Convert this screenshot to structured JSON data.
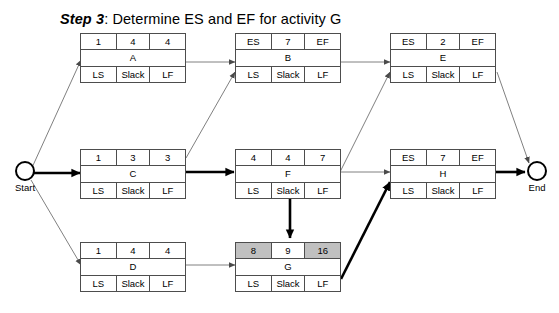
{
  "title": {
    "step": "Step 3",
    "rest": ": Determine ES and EF for activity G"
  },
  "colors": {
    "highlight": "#c0c0c0",
    "box_border": "#4d4d4d",
    "thin_edge": "#808080",
    "bold_edge": "#000000",
    "text": "#000000",
    "background": "#ffffff"
  },
  "terminators": {
    "start": {
      "label": "Start"
    },
    "end": {
      "label": "End"
    }
  },
  "labels": {
    "ls": "LS",
    "slack": "Slack",
    "lf": "LF",
    "es": "ES",
    "ef": "EF"
  },
  "nodes": [
    {
      "id": "A",
      "name": "A",
      "top": {
        "left": "1",
        "middle": "4",
        "right": "4"
      },
      "bottom": {
        "left": "LS",
        "middle": "Slack",
        "right": "LF"
      },
      "highlight": {
        "left": false,
        "middle": false,
        "right": false
      }
    },
    {
      "id": "B",
      "name": "B",
      "top": {
        "left": "ES",
        "middle": "7",
        "right": "EF"
      },
      "bottom": {
        "left": "LS",
        "middle": "Slack",
        "right": "LF"
      },
      "highlight": {
        "left": false,
        "middle": false,
        "right": false
      }
    },
    {
      "id": "E",
      "name": "E",
      "top": {
        "left": "ES",
        "middle": "2",
        "right": "EF"
      },
      "bottom": {
        "left": "LS",
        "middle": "Slack",
        "right": "LF"
      },
      "highlight": {
        "left": false,
        "middle": false,
        "right": false
      }
    },
    {
      "id": "C",
      "name": "C",
      "top": {
        "left": "1",
        "middle": "3",
        "right": "3"
      },
      "bottom": {
        "left": "LS",
        "middle": "Slack",
        "right": "LF"
      },
      "highlight": {
        "left": false,
        "middle": false,
        "right": false
      }
    },
    {
      "id": "F",
      "name": "F",
      "top": {
        "left": "4",
        "middle": "4",
        "right": "7"
      },
      "bottom": {
        "left": "LS",
        "middle": "Slack",
        "right": "LF"
      },
      "highlight": {
        "left": false,
        "middle": false,
        "right": false
      }
    },
    {
      "id": "H",
      "name": "H",
      "top": {
        "left": "ES",
        "middle": "7",
        "right": "EF"
      },
      "bottom": {
        "left": "LS",
        "middle": "Slack",
        "right": "LF"
      },
      "highlight": {
        "left": false,
        "middle": false,
        "right": false
      }
    },
    {
      "id": "D",
      "name": "D",
      "top": {
        "left": "1",
        "middle": "4",
        "right": "4"
      },
      "bottom": {
        "left": "LS",
        "middle": "Slack",
        "right": "LF"
      },
      "highlight": {
        "left": false,
        "middle": false,
        "right": false
      }
    },
    {
      "id": "G",
      "name": "G",
      "top": {
        "left": "8",
        "middle": "9",
        "right": "16"
      },
      "bottom": {
        "left": "LS",
        "middle": "Slack",
        "right": "LF"
      },
      "highlight": {
        "left": true,
        "middle": false,
        "right": true
      }
    }
  ],
  "edges": [
    {
      "from": "Start",
      "to": "A",
      "style": "thin"
    },
    {
      "from": "Start",
      "to": "C",
      "style": "bold"
    },
    {
      "from": "Start",
      "to": "D",
      "style": "thin"
    },
    {
      "from": "A",
      "to": "B",
      "style": "thin"
    },
    {
      "from": "C",
      "to": "B",
      "style": "thin"
    },
    {
      "from": "C",
      "to": "F",
      "style": "bold"
    },
    {
      "from": "B",
      "to": "E",
      "style": "thin"
    },
    {
      "from": "F",
      "to": "E",
      "style": "thin"
    },
    {
      "from": "F",
      "to": "H",
      "style": "thin"
    },
    {
      "from": "F",
      "to": "G",
      "style": "bold"
    },
    {
      "from": "D",
      "to": "G",
      "style": "thin"
    },
    {
      "from": "G",
      "to": "H",
      "style": "bold"
    },
    {
      "from": "E",
      "to": "End",
      "style": "thin"
    },
    {
      "from": "H",
      "to": "End",
      "style": "bold"
    }
  ]
}
